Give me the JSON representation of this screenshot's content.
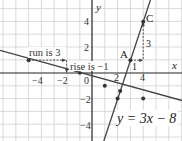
{
  "axes": {
    "x_label": "x",
    "y_label": "y"
  },
  "x_ticks": [
    {
      "value": -4,
      "label": "−4"
    },
    {
      "value": -2,
      "label": "−2"
    },
    {
      "value": 2,
      "label": "2"
    },
    {
      "value": 4,
      "label": "4"
    }
  ],
  "y_ticks": [
    {
      "value": 4,
      "label": "4"
    },
    {
      "value": 2,
      "label": "2"
    },
    {
      "value": -2,
      "label": "−2"
    },
    {
      "value": -4,
      "label": "−4"
    }
  ],
  "origin_label": "0",
  "lines": [
    {
      "name": "steep-line",
      "equation": "y = 3x − 8"
    },
    {
      "name": "shallow-line",
      "equation": "y = -x/3 - 2/3"
    }
  ],
  "points": [
    {
      "label": "A",
      "x": 3,
      "y": 1
    },
    {
      "label": "C",
      "x": 4,
      "y": 4
    }
  ],
  "annotations": {
    "run": "run is 3",
    "rise": "rise is −1",
    "step_run": "1",
    "step_rise": "3",
    "equation": "y = 3x − 8"
  },
  "colors": {
    "grid": "#cfcfcf",
    "axis": "#222222",
    "line": "#333333"
  }
}
